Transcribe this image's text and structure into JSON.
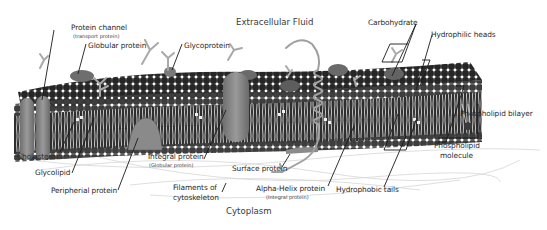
{
  "diagram": {
    "regions": {
      "top": "Extracellular Fluid",
      "bottom": "Cytoplasm"
    },
    "labels": {
      "protein_channel": "Protein channel",
      "protein_channel_sub": "(transport protein)",
      "globular_protein": "Globular protein",
      "glycoprotein": "Glycoprotein",
      "carbohydrate": "Carbohydrate",
      "hydrophilic_heads": "Hydrophilic heads",
      "phospholipid_bilayer": "Phospholipid bilayer",
      "phospholipid_molecule_1": "Phospholipid",
      "phospholipid_molecule_2": "molecule",
      "cholesterol": "Cholesterol",
      "glycolipid": "Glycolipid",
      "peripheral_protein": "Peripherial protein",
      "integral_protein": "Integral protein",
      "integral_protein_sub": "(Globular protein)",
      "surface_protein": "Surface protein",
      "filaments_1": "Filaments of",
      "filaments_2": "cytoskeleton",
      "alpha_helix_protein": "Alpha-Helix protein",
      "alpha_helix_protein_sub": "(Integral protein)",
      "hydrophobic_tails": "Hydrophobic tails"
    },
    "colors": {
      "background": "#ffffff",
      "head_dark": "#2b2b2b",
      "head_mid": "#4a4a4a",
      "tail": "#d8d8d8",
      "core": "#333333",
      "protein": "#8a8a8a",
      "carb": "#a8a8a8",
      "leader": "#1a1a1a"
    }
  }
}
